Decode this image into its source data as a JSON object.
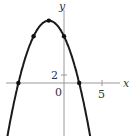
{
  "chart_data": {
    "type": "line",
    "title": "",
    "xlabel": "x",
    "ylabel": "y",
    "function": "y = -x^2 - 4x + 12",
    "x_ticks": [
      {
        "value": 5,
        "label": "5"
      }
    ],
    "y_ticks": [
      {
        "value": 2,
        "label": "2"
      }
    ],
    "origin_label": "0",
    "xlim": [
      -8,
      9
    ],
    "ylim": [
      -14,
      20
    ],
    "grid": false,
    "series": [
      {
        "name": "parabola",
        "x": [
          -8.3,
          -7,
          -6,
          -5,
          -4,
          -3,
          -2,
          -1,
          0,
          1,
          2,
          3,
          3.9
        ],
        "y": [
          -24.5,
          -9,
          0,
          7,
          12,
          15,
          16,
          15,
          12,
          7,
          0,
          -9,
          -18.8
        ]
      }
    ],
    "marked_points": [
      {
        "x": -6,
        "y": 0
      },
      {
        "x": -4,
        "y": 12
      },
      {
        "x": -2,
        "y": 16
      },
      {
        "x": 0,
        "y": 12
      },
      {
        "x": 2,
        "y": 0
      }
    ]
  }
}
